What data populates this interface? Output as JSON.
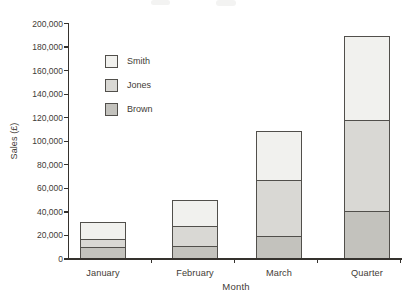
{
  "figure": {
    "background_color": "#ffffff",
    "axis_color": "#35322e",
    "segment_border_color": "#514f4b",
    "text_color": "#3f3b36"
  },
  "chart_data": {
    "type": "bar",
    "subtype": "stacked",
    "title": "",
    "xlabel": "Month",
    "ylabel": "Sales (£)",
    "categories": [
      "January",
      "February",
      "March",
      "Quarter"
    ],
    "series": [
      {
        "name": "Smith",
        "color": "#f1f1ee",
        "values": [
          14000,
          22000,
          41000,
          71000
        ]
      },
      {
        "name": "Jones",
        "color": "#d9d8d4",
        "values": [
          7000,
          17000,
          48000,
          78000
        ]
      },
      {
        "name": "Brown",
        "color": "#c3c2bd",
        "values": [
          10000,
          11000,
          19000,
          40000
        ]
      }
    ],
    "stack_order_bottom_to_top": [
      "Brown",
      "Jones",
      "Smith"
    ],
    "bar_totals": [
      31000,
      50000,
      108000,
      189000
    ],
    "ylim": [
      0,
      200000
    ],
    "ytick_step": 20000,
    "ytick_labels": [
      "0",
      "20,000",
      "40,000",
      "60,000",
      "80,000",
      "100,000",
      "120,000",
      "140,000",
      "160,000",
      "180,000",
      "200,000"
    ],
    "grid": "off",
    "legend_position": "upper-left-inside"
  }
}
